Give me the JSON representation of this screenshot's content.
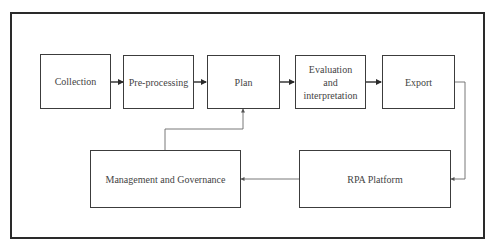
{
  "diagram": {
    "top_row": [
      {
        "id": "collection",
        "label": "Collection"
      },
      {
        "id": "pre-processing",
        "label": "Pre-processing"
      },
      {
        "id": "plan",
        "label": "Plan"
      },
      {
        "id": "evaluation",
        "label": "Evaluation and interpretation"
      },
      {
        "id": "export",
        "label": "Export"
      }
    ],
    "bottom_row": [
      {
        "id": "management",
        "label": "Management and Governance"
      },
      {
        "id": "rpa-platform",
        "label": "RPA Platform"
      }
    ],
    "edges": [
      {
        "from": "Collection",
        "to": "Pre-processing"
      },
      {
        "from": "Pre-processing",
        "to": "Plan"
      },
      {
        "from": "Plan",
        "to": "Evaluation and interpretation"
      },
      {
        "from": "Evaluation and interpretation",
        "to": "Export"
      },
      {
        "from": "Export",
        "to": "RPA Platform"
      },
      {
        "from": "RPA Platform",
        "to": "Management and Governance"
      },
      {
        "from": "Management and Governance",
        "to": "Plan"
      }
    ],
    "colors": {
      "line": "#3c3c3c",
      "thin_line": "#6a6a6a",
      "background": "#ffffff"
    }
  }
}
